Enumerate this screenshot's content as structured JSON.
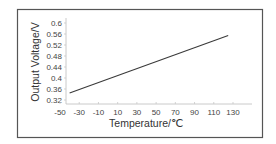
{
  "chart_data": {
    "type": "line",
    "title": "",
    "xlabel": "Temperature/℃",
    "ylabel": "Output Voltage/V",
    "x_ticks": [
      -50,
      -30,
      -10,
      10,
      30,
      50,
      70,
      90,
      110,
      130
    ],
    "y_ticks": [
      0.32,
      0.36,
      0.4,
      0.44,
      0.48,
      0.52,
      0.56,
      0.6
    ],
    "x_tick_labels": [
      "-50",
      "-30",
      "-10",
      "10",
      "30",
      "50",
      "70",
      "90",
      "110",
      "130"
    ],
    "y_tick_labels": [
      "0.32",
      "0.36",
      "0.4",
      "0.44",
      "0.48",
      "0.52",
      "0.56",
      "0.6"
    ],
    "xlim": [
      -55,
      145
    ],
    "ylim": [
      0.31,
      0.61
    ],
    "grid": false,
    "legend": null,
    "series": [
      {
        "name": "Output Voltage",
        "x": [
          -40,
          125
        ],
        "y": [
          0.345,
          0.555
        ]
      }
    ],
    "colors": {
      "line": "#3a3a3a",
      "frame": "#555555",
      "axis": "#bdbdbd"
    }
  }
}
